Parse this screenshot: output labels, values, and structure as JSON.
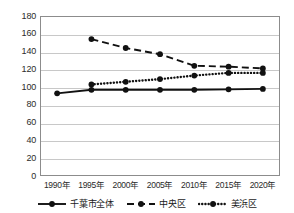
{
  "chart_data": {
    "type": "line",
    "title": "",
    "subtitle": "",
    "xlabel": "",
    "ylabel": "",
    "categories": [
      "1990年",
      "1995年",
      "2000年",
      "2005年",
      "2010年",
      "2015年",
      "2020年"
    ],
    "ylim": [
      0,
      180
    ],
    "yticks": [
      0,
      20,
      40,
      60,
      80,
      100,
      120,
      140,
      160,
      180
    ],
    "ytick_labels": [
      "0",
      "20",
      "40",
      "60",
      "80",
      "100",
      "120",
      "140",
      "160",
      "180"
    ],
    "grid": true,
    "legend_position": "bottom",
    "series": [
      {
        "name": "千葉市全体",
        "style": "solid",
        "marker": "circle",
        "color": "#111111",
        "values": [
          93,
          97,
          97,
          97,
          97,
          97.5,
          98
        ]
      },
      {
        "name": "中央区",
        "style": "dashed",
        "marker": "circle",
        "color": "#111111",
        "values": [
          null,
          154,
          144,
          137,
          124,
          123,
          121
        ]
      },
      {
        "name": "美浜区",
        "style": "dotted",
        "marker": "circle",
        "color": "#111111",
        "values": [
          null,
          103,
          106,
          109,
          113,
          116,
          116
        ]
      }
    ]
  },
  "axes": {
    "frame_color": "#8c8c8c",
    "grid_color": "#c8c8c8"
  }
}
